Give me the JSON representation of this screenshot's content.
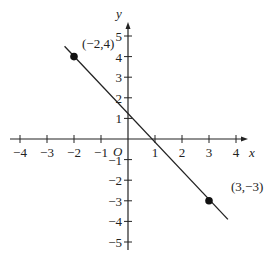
{
  "chart_data": {
    "type": "line",
    "title": "",
    "xlabel": "x",
    "ylabel": "y",
    "origin_label": "O",
    "xlim": [
      -4,
      4
    ],
    "ylim": [
      -5,
      5
    ],
    "x_ticks": [
      -4,
      -3,
      -2,
      -1,
      1,
      2,
      3,
      4
    ],
    "x_tick_labels": [
      "−4",
      "−3",
      "−2",
      "−1",
      "1",
      "2",
      "3",
      "4"
    ],
    "y_ticks": [
      5,
      4,
      3,
      2,
      1,
      -1,
      -2,
      -3,
      -4,
      -5
    ],
    "y_tick_labels": [
      "5",
      "4",
      "3",
      "2",
      "1",
      "−1",
      "−2",
      "−3",
      "−4",
      "−5"
    ],
    "grid": false,
    "series": [
      {
        "name": "line through (-2,4) and (3,-3)",
        "x": [
          -2.35,
          3.7
        ],
        "y": [
          4.5,
          -3.9
        ],
        "color": "#222222"
      }
    ],
    "points": [
      {
        "x": -2,
        "y": 4,
        "label": "(−2,4)"
      },
      {
        "x": 3,
        "y": -3,
        "label": "(3,−3)"
      }
    ]
  }
}
